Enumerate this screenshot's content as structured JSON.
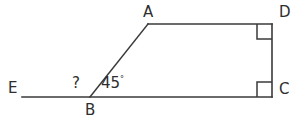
{
  "figure": {
    "background_color": "#ffffff",
    "stroke_color": "#3a3a3a",
    "text_color": "#2e2e2e",
    "vertices": {
      "A": {
        "label": "A",
        "x": 148,
        "y": 24
      },
      "B": {
        "label": "B",
        "x": 90,
        "y": 97
      },
      "C": {
        "label": "C",
        "x": 272,
        "y": 97
      },
      "D": {
        "label": "D",
        "x": 272,
        "y": 24
      },
      "E": {
        "label": "E",
        "x": 22,
        "y": 97
      }
    },
    "angles": {
      "unknown": {
        "label": "?",
        "at_vertex": "B",
        "description": "angle EBA",
        "value": "?"
      },
      "known": {
        "label": "45",
        "degree_symbol": "°",
        "at_vertex": "B",
        "description": "angle ABC",
        "value": "45°"
      },
      "right_angle_c": {
        "label": "",
        "at_vertex": "C",
        "marker": "right-angle-square",
        "value": "90°"
      },
      "right_angle_d": {
        "label": "",
        "at_vertex": "D",
        "marker": "right-angle-square",
        "value": "90°"
      }
    },
    "segments": [
      {
        "name": "EB",
        "from": "E",
        "to": "B"
      },
      {
        "name": "BC",
        "from": "B",
        "to": "C"
      },
      {
        "name": "BA",
        "from": "B",
        "to": "A"
      },
      {
        "name": "AD",
        "from": "A",
        "to": "D"
      },
      {
        "name": "DC",
        "from": "D",
        "to": "C"
      }
    ]
  }
}
